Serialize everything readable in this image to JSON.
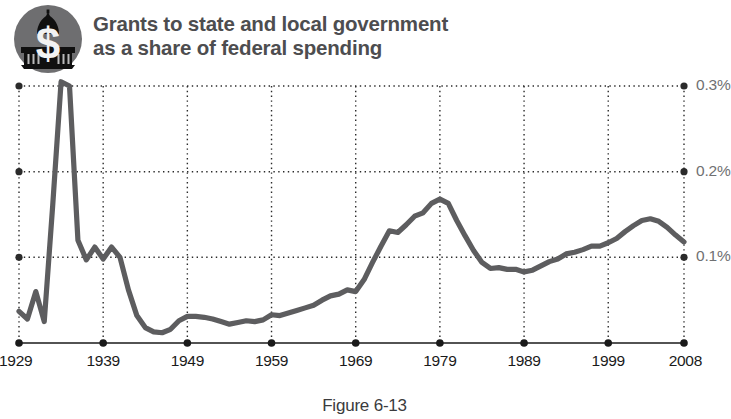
{
  "header": {
    "title": "Grants to state and local government\nas a share of federal spending",
    "emblem_label": "capitol-dollar-emblem"
  },
  "caption": "Figure 6-13",
  "colors": {
    "line": "#5d5d5f",
    "grid": "#2b2b2b",
    "axis": "#1a1a1a",
    "y_label": "#6f7072",
    "x_label": "#1a1a1a",
    "title": "#4d4d4f",
    "emblem_circle": "#6e6e70",
    "emblem_dome": "#101010",
    "emblem_dollar": "#f2f2f2"
  },
  "chart_data": {
    "type": "line",
    "title": "Grants to state and local government as a share of federal spending",
    "xlabel": "",
    "ylabel": "",
    "xlim": [
      1929,
      2008
    ],
    "ylim": [
      0,
      0.3
    ],
    "grid": true,
    "legend": null,
    "y_ticks": [
      0.1,
      0.2,
      0.3
    ],
    "y_tick_labels": [
      "0.1%",
      "0.2%",
      "0.3%"
    ],
    "x_ticks": [
      1929,
      1939,
      1949,
      1959,
      1969,
      1979,
      1989,
      1999,
      2008
    ],
    "x_tick_labels": [
      "1929",
      "1939",
      "1949",
      "1959",
      "1969",
      "1979",
      "1989",
      "1999",
      "2008"
    ],
    "series": [
      {
        "name": "Grants to state and local government as a share of federal spending",
        "x": [
          1929,
          1930,
          1931,
          1932,
          1933,
          1934,
          1935,
          1936,
          1937,
          1938,
          1939,
          1940,
          1941,
          1942,
          1943,
          1944,
          1945,
          1946,
          1947,
          1948,
          1949,
          1950,
          1951,
          1952,
          1953,
          1954,
          1955,
          1956,
          1957,
          1958,
          1959,
          1960,
          1961,
          1962,
          1963,
          1964,
          1965,
          1966,
          1967,
          1968,
          1969,
          1970,
          1971,
          1972,
          1973,
          1974,
          1975,
          1976,
          1977,
          1978,
          1979,
          1980,
          1981,
          1982,
          1983,
          1984,
          1985,
          1986,
          1987,
          1988,
          1989,
          1990,
          1991,
          1992,
          1993,
          1994,
          1995,
          1996,
          1997,
          1998,
          1999,
          2000,
          2001,
          2002,
          2003,
          2004,
          2005,
          2006,
          2007,
          2008
        ],
        "y": [
          0.037,
          0.028,
          0.06,
          0.025,
          0.16,
          0.305,
          0.3,
          0.12,
          0.097,
          0.112,
          0.098,
          0.112,
          0.1,
          0.062,
          0.032,
          0.018,
          0.013,
          0.012,
          0.016,
          0.026,
          0.031,
          0.031,
          0.03,
          0.028,
          0.025,
          0.022,
          0.024,
          0.026,
          0.025,
          0.027,
          0.033,
          0.032,
          0.035,
          0.038,
          0.041,
          0.044,
          0.05,
          0.055,
          0.057,
          0.062,
          0.06,
          0.074,
          0.094,
          0.113,
          0.131,
          0.129,
          0.138,
          0.148,
          0.152,
          0.163,
          0.168,
          0.163,
          0.143,
          0.125,
          0.108,
          0.094,
          0.087,
          0.088,
          0.086,
          0.086,
          0.083,
          0.085,
          0.09,
          0.095,
          0.098,
          0.104,
          0.106,
          0.109,
          0.113,
          0.113,
          0.117,
          0.122,
          0.13,
          0.137,
          0.143,
          0.145,
          0.142,
          0.135,
          0.126,
          0.118
        ]
      }
    ],
    "annotations": {
      "peak_1934": {
        "year": 1934,
        "value": 0.305
      },
      "trough_1946": {
        "year": 1946,
        "value": 0.012
      },
      "peak_1979": {
        "year": 1979,
        "value": 0.168
      },
      "end_2008": {
        "year": 2008,
        "value": 0.118
      }
    }
  }
}
